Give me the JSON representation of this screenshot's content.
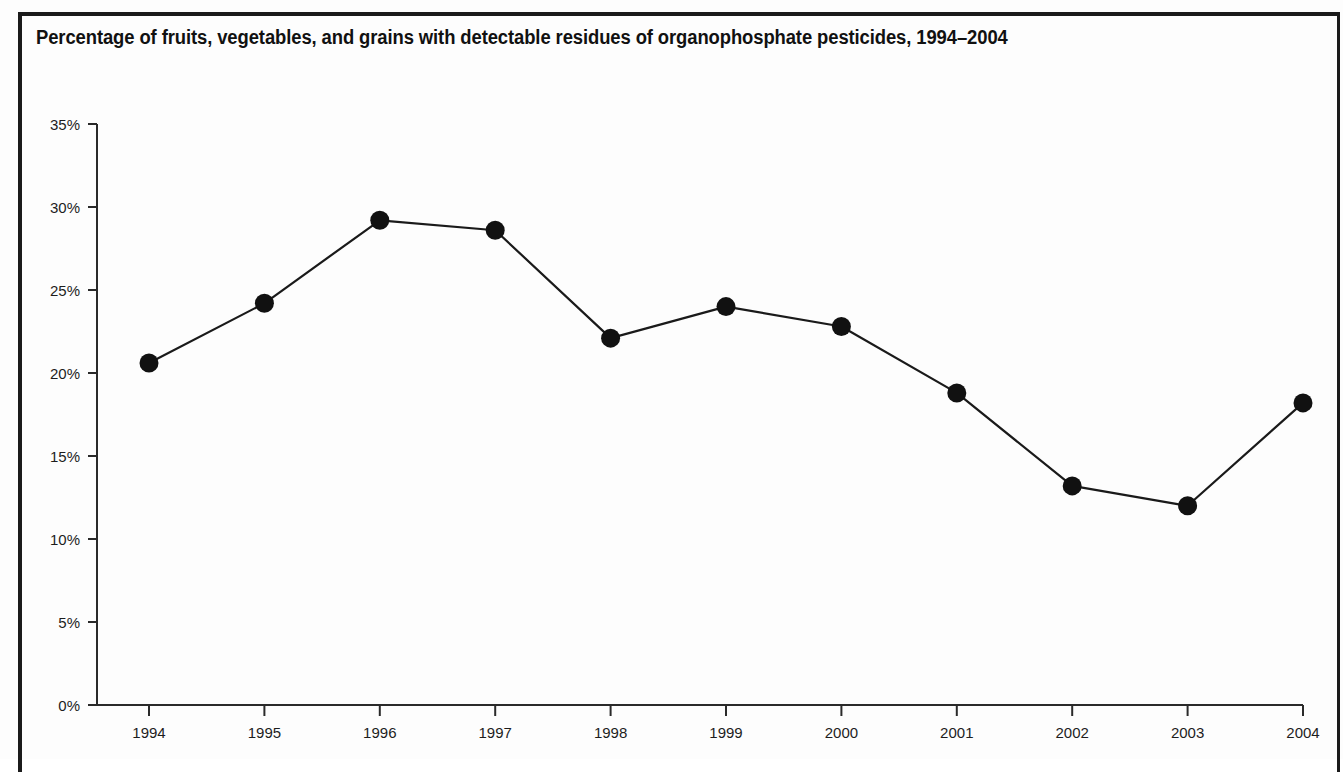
{
  "figure": {
    "title": "Percentage of fruits, vegetables, and grains with detectable residues of organophosphate pesticides, 1994–2004",
    "background_color": "#fdfdfd",
    "frame_color": "#1b1b1b",
    "ink_color": "#1a1a1a"
  },
  "chart_data": {
    "type": "line",
    "title": "Percentage of fruits, vegetables, and grains with detectable residues of organophosphate pesticides, 1994–2004",
    "xlabel": "",
    "ylabel": "",
    "categories": [
      "1994",
      "1995",
      "1996",
      "1997",
      "1998",
      "1999",
      "2000",
      "2001",
      "2002",
      "2003",
      "2004"
    ],
    "x": [
      1994,
      1995,
      1996,
      1997,
      1998,
      1999,
      2000,
      2001,
      2002,
      2003,
      2004
    ],
    "values": [
      20.6,
      24.2,
      29.2,
      28.6,
      22.1,
      24.0,
      22.8,
      18.8,
      13.2,
      12.0,
      18.2
    ],
    "series": [
      {
        "name": "Percentage with detectable organophosphate residues",
        "values": [
          20.6,
          24.2,
          29.2,
          28.6,
          22.1,
          24.0,
          22.8,
          18.8,
          13.2,
          12.0,
          18.2
        ],
        "line_color": "#1a1a1a",
        "marker": "circle",
        "marker_color": "#111111"
      }
    ],
    "ylim": [
      0,
      35
    ],
    "xlim": [
      1994,
      2004
    ],
    "y_ticks": [
      0,
      5,
      10,
      15,
      20,
      25,
      30,
      35
    ],
    "y_tick_labels": [
      "0%",
      "5%",
      "10%",
      "15%",
      "20%",
      "25%",
      "30%",
      "35%"
    ],
    "x_ticks": [
      1994,
      1995,
      1996,
      1997,
      1998,
      1999,
      2000,
      2001,
      2002,
      2003,
      2004
    ],
    "x_tick_labels": [
      "1994",
      "1995",
      "1996",
      "1997",
      "1998",
      "1999",
      "2000",
      "2001",
      "2002",
      "2003",
      "2004"
    ],
    "grid": false,
    "legend": null,
    "legend_position": "none",
    "annotations": []
  },
  "geometry": {
    "plot_left": 97,
    "plot_right": 1303,
    "plot_top": 124,
    "plot_bottom": 705,
    "first_tick_x": 149,
    "tick_spacing_x": 115.4,
    "axis_line_width": 2,
    "series_line_width": 2.2,
    "marker_radius": 9.5,
    "y_tick_length": 9,
    "x_tick_length": 11
  }
}
